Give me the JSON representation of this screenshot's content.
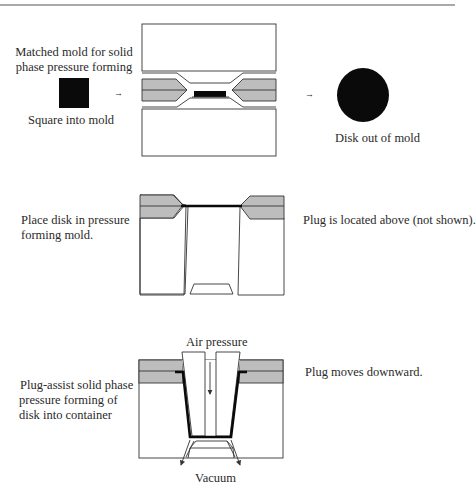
{
  "figure": {
    "colors": {
      "line": "#333333",
      "mold_plate_fill": "#bdbdbd",
      "material": "#0a0a0a",
      "background": "#ffffff"
    },
    "step1": {
      "mold_title_line1": "Matched mold for solid",
      "mold_title_line2": "phase pressure forming",
      "square_label": "Square into mold",
      "disk_label": "Disk out of mold",
      "arrow_glyph": "→"
    },
    "step2": {
      "left_label_line1": "Place disk in pressure",
      "left_label_line2": "forming mold.",
      "right_label": "Plug is located above (not shown)."
    },
    "step3": {
      "left_label_line1": "Plug-assist solid phase",
      "left_label_line2": "pressure forming of",
      "left_label_line3": "disk into container",
      "top_label": "Air pressure",
      "bottom_label": "Vacuum",
      "right_label": "Plug moves downward."
    }
  }
}
